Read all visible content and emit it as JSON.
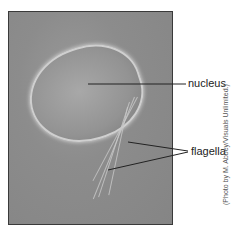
{
  "figure": {
    "labels": {
      "nucleus": "nucleus",
      "flagella": "flagella"
    },
    "credit": "(Photo by M. Abbey/Visuals Unlimited.)"
  }
}
